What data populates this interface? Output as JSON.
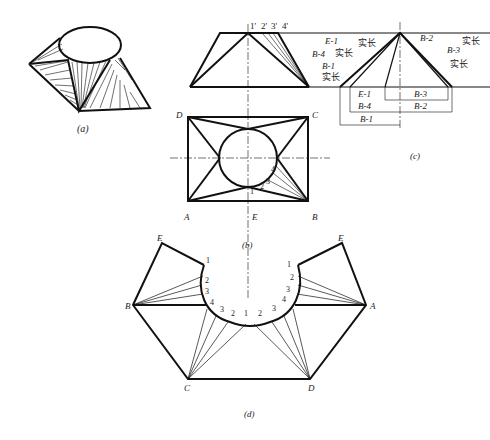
{
  "figure": {
    "subfigure_labels": {
      "a": "(a)",
      "b": "(b)",
      "c": "(c)",
      "d": "(d)"
    },
    "view_a": {
      "description": "isometric sketch of square-to-round transition piece"
    },
    "view_b": {
      "corner_labels": {
        "A": "A",
        "B": "B",
        "C": "C",
        "D": "D",
        "E": "E"
      },
      "circle_points": [
        "1",
        "2",
        "3",
        "4"
      ]
    },
    "front_view": {
      "top_points": [
        "1'",
        "2'",
        "3'",
        "4'"
      ]
    },
    "view_c": {
      "left_labels": [
        "E-1",
        "B-4",
        "B-1"
      ],
      "true_length": "实长",
      "right_labels": [
        "B-2",
        "B-3"
      ],
      "dim_labels": [
        "E-1",
        "B-4",
        "B-1",
        "B-3",
        "B-2"
      ]
    },
    "view_d": {
      "vertex_labels": {
        "E_left": "E",
        "E_right": "E",
        "B": "B",
        "A": "A",
        "C": "C",
        "D": "D"
      },
      "left_arc_points": [
        "1",
        "2",
        "3",
        "4"
      ],
      "bottom_arc_points": [
        "3",
        "2",
        "1",
        "2",
        "3"
      ],
      "right_arc_points": [
        "1",
        "2",
        "3",
        "4"
      ]
    }
  }
}
